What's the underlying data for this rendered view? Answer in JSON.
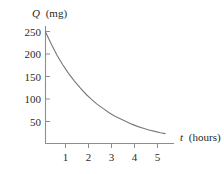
{
  "figure": {
    "background_color": "#ffffff",
    "axis_color": "#8d8d8d",
    "curve_color": "#7a7a7a",
    "text_color": "#2b2b2b"
  },
  "labels": {
    "y_axis_variable": "Q",
    "y_axis_unit": "(mg)",
    "x_axis_variable": "t",
    "x_axis_unit": "(hours)"
  },
  "chart_data": {
    "type": "line",
    "title": "",
    "subtitle": "",
    "xlabel": "t (hours)",
    "ylabel": "Q (mg)",
    "xlim": [
      0,
      5.6
    ],
    "ylim": [
      0,
      262
    ],
    "grid": false,
    "legend": null,
    "x_ticks": [
      1,
      2,
      3,
      4,
      5
    ],
    "x_tick_labels": [
      "1",
      "2",
      "3",
      "4",
      "5"
    ],
    "y_ticks": [
      50,
      100,
      150,
      200,
      250
    ],
    "y_tick_labels": [
      "50",
      "100",
      "150",
      "200",
      "250"
    ],
    "series": [
      {
        "name": "Q(t)",
        "description": "exponential decay of quantity Q in milligrams over time t in hours",
        "x": [
          0,
          0.25,
          0.5,
          0.75,
          1,
          1.25,
          1.5,
          1.75,
          2,
          2.25,
          2.5,
          2.75,
          3,
          3.25,
          3.5,
          3.75,
          4,
          4.25,
          4.5,
          4.75,
          5,
          5.2
        ],
        "y": [
          248,
          221,
          196,
          175,
          156,
          139,
          124,
          110,
          98,
          87,
          78,
          69,
          61,
          55,
          49,
          43,
          38,
          34,
          30,
          27,
          24,
          22
        ]
      }
    ],
    "annotations": []
  }
}
